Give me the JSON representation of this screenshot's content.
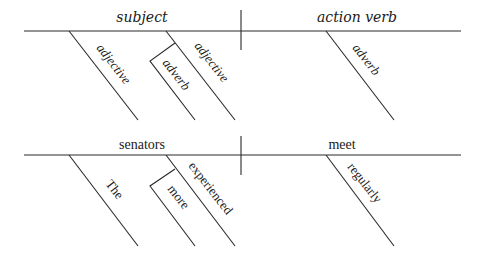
{
  "template_diagram": {
    "subject_label": "subject",
    "verb_label": "action verb",
    "modifiers": {
      "adjective_1": "adjective",
      "adverb_of_adjective": "adverb",
      "adjective_2": "adjective",
      "verb_adverb": "adverb"
    }
  },
  "example_diagram": {
    "subject_label": "senators",
    "verb_label": "meet",
    "modifiers": {
      "article": "The",
      "adverb_of_adjective": "more",
      "adjective": "experienced",
      "verb_adverb": "regularly"
    }
  }
}
